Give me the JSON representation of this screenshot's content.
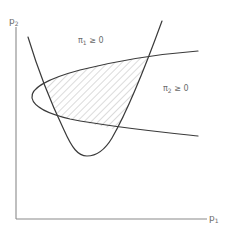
{
  "figure": {
    "axes": {
      "y_label": {
        "base": "p",
        "sub": "2"
      },
      "x_label": {
        "base": "p",
        "sub": "1"
      }
    },
    "regions": [
      {
        "id": "pi1",
        "symbol": "π",
        "sub": "1",
        "relation": "≥ 0"
      },
      {
        "id": "pi2",
        "symbol": "π",
        "sub": "2",
        "relation": "≥ 0"
      }
    ],
    "feasible_region": {
      "fill": "hatched",
      "description": "intersection of π1 ≥ 0 and π2 ≥ 0"
    },
    "colors": {
      "curve": "#3a3a3a",
      "axis": "#8a8a8a",
      "label": "#6a6a6a",
      "hatch": "#b0b0b0"
    }
  }
}
